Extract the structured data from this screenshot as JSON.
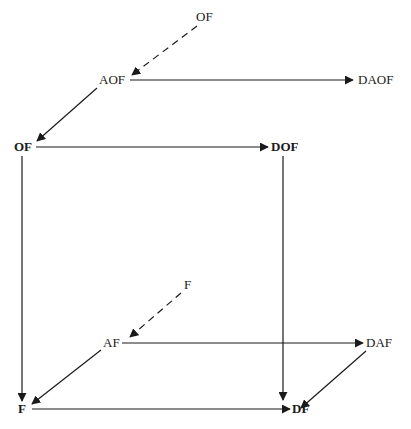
{
  "diagram": {
    "type": "commutative-cube",
    "nodes": {
      "of_source": {
        "label": "OF",
        "bold": false
      },
      "aof": {
        "label": "AOF",
        "bold": false
      },
      "daof": {
        "label": "DAOF",
        "bold": false
      },
      "of": {
        "label": "OF",
        "bold": true
      },
      "dof": {
        "label": "DOF",
        "bold": true
      },
      "f_source": {
        "label": "F",
        "bold": false
      },
      "af": {
        "label": "AF",
        "bold": false
      },
      "daf": {
        "label": "DAF",
        "bold": false
      },
      "f": {
        "label": "F",
        "bold": true
      },
      "df": {
        "label": "DF",
        "bold": true
      }
    },
    "edges": [
      {
        "from": "OF (source)",
        "to": "AOF",
        "style": "dashed"
      },
      {
        "from": "AOF",
        "to": "DAOF",
        "style": "solid"
      },
      {
        "from": "AOF",
        "to": "OF",
        "style": "solid"
      },
      {
        "from": "OF",
        "to": "DOF",
        "style": "solid"
      },
      {
        "from": "OF",
        "to": "F",
        "style": "solid"
      },
      {
        "from": "DOF",
        "to": "DF",
        "style": "solid"
      },
      {
        "from": "F (source)",
        "to": "AF",
        "style": "dashed"
      },
      {
        "from": "AF",
        "to": "DAF",
        "style": "solid"
      },
      {
        "from": "AF",
        "to": "F",
        "style": "solid"
      },
      {
        "from": "F",
        "to": "DF",
        "style": "solid"
      },
      {
        "from": "DAF",
        "to": "DF",
        "style": "solid"
      }
    ],
    "colors": {
      "line": "#1a1a1a",
      "background": "#ffffff"
    }
  }
}
